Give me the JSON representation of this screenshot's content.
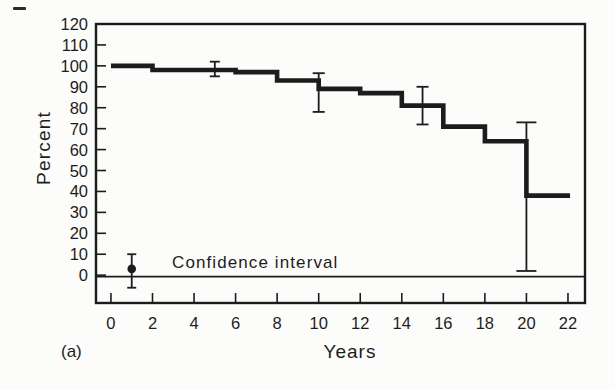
{
  "figure": {
    "background": "#fcfcfb",
    "ink": "#1c1c1c",
    "panel_label": "(a)"
  },
  "chart_data": {
    "type": "line",
    "subtype": "step-survival-curve",
    "title": "",
    "xlabel": "Years",
    "ylabel": "Percent",
    "xlim": [
      -0.72,
      22.82
    ],
    "ylim": [
      -13.3,
      120
    ],
    "xticks": [
      0,
      2,
      4,
      6,
      8,
      10,
      12,
      14,
      16,
      18,
      20,
      22
    ],
    "yticks": [
      0,
      10,
      20,
      30,
      40,
      50,
      60,
      70,
      80,
      90,
      100,
      110,
      120
    ],
    "grid": false,
    "baseline_y": 0,
    "series": [
      {
        "name": "survival-percent",
        "color": "#1c1c1c",
        "step_points": [
          [
            0,
            100
          ],
          [
            2,
            100
          ],
          [
            2,
            98
          ],
          [
            6,
            98
          ],
          [
            6,
            97
          ],
          [
            8,
            97
          ],
          [
            8,
            93
          ],
          [
            10,
            93
          ],
          [
            10,
            89
          ],
          [
            12,
            89
          ],
          [
            12,
            87
          ],
          [
            14,
            87
          ],
          [
            14,
            81
          ],
          [
            16,
            81
          ],
          [
            16,
            71
          ],
          [
            18,
            71
          ],
          [
            18,
            64
          ],
          [
            20,
            64
          ],
          [
            20,
            38
          ],
          [
            22.1,
            38
          ]
        ]
      }
    ],
    "error_bars": [
      {
        "x": 5,
        "low": 95,
        "high": 102,
        "cap_px": 10
      },
      {
        "x": 10,
        "low": 78,
        "high": 96.5,
        "cap_px": 12
      },
      {
        "x": 15,
        "low": 72,
        "high": 90,
        "cap_px": 12
      },
      {
        "x": 20,
        "low": 2,
        "high": 73,
        "cap_px": 20
      }
    ],
    "legend": {
      "label": "Confidence interval",
      "position": "inside-bottom-left",
      "marker": {
        "x": 1,
        "dot_y": 3,
        "low": -6,
        "high": 10,
        "cap_px": 9,
        "dot_radius_px": 4.3
      }
    }
  }
}
